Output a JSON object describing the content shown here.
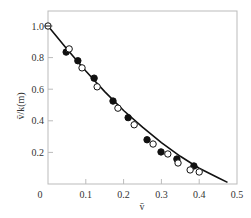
{
  "chart_data": {
    "type": "scatter",
    "title": "",
    "xlabel": "v̄",
    "ylabel": "v̄/k(m)",
    "xlim": [
      0,
      0.5
    ],
    "ylim": [
      0,
      1.1
    ],
    "xticks": [
      0,
      0.1,
      0.2,
      0.3,
      0.4,
      0.5
    ],
    "xtick_labels": [
      "0",
      "0.1",
      "0.2",
      "0.3",
      "0.4",
      "0.5"
    ],
    "yticks": [
      0.2,
      0.4,
      0.6,
      0.8,
      1.0
    ],
    "ytick_labels": [
      "0.2",
      "0.4",
      "0.6",
      "0.8",
      "1.0"
    ],
    "grid": false,
    "legend": null,
    "series": [
      {
        "name": "filled",
        "marker": "filled-circle",
        "x": [
          0.048,
          0.079,
          0.122,
          0.172,
          0.212,
          0.262,
          0.299,
          0.341,
          0.386
        ],
        "y": [
          0.835,
          0.78,
          0.67,
          0.525,
          0.42,
          0.28,
          0.203,
          0.158,
          0.114
        ]
      },
      {
        "name": "open",
        "marker": "open-circle",
        "x": [
          0.0,
          0.056,
          0.09,
          0.13,
          0.185,
          0.228,
          0.278,
          0.317,
          0.344,
          0.376,
          0.4
        ],
        "y": [
          1.0,
          0.855,
          0.735,
          0.615,
          0.48,
          0.375,
          0.253,
          0.19,
          0.133,
          0.089,
          0.076
        ]
      },
      {
        "name": "fit",
        "type": "line",
        "x": [
          0.0,
          0.05,
          0.1,
          0.15,
          0.2,
          0.25,
          0.3,
          0.35,
          0.4,
          0.45,
          0.475
        ],
        "y": [
          1.0,
          0.855,
          0.715,
          0.585,
          0.465,
          0.36,
          0.262,
          0.175,
          0.1,
          0.04,
          0.01
        ]
      }
    ]
  },
  "labels": {
    "x_axis": "v̄",
    "y_axis": "v̄/k(m)",
    "x_ticks": [
      "0",
      "0.1",
      "0.2",
      "0.3",
      "0.4",
      "0.5"
    ],
    "y_ticks": [
      "0.2",
      "0.4",
      "0.6",
      "0.8",
      "1.0"
    ]
  }
}
